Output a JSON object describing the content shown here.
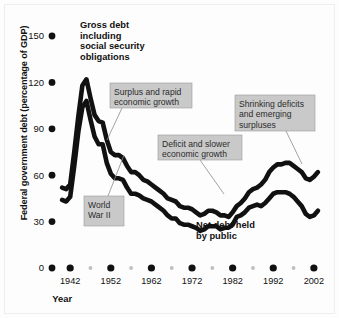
{
  "chart_data": {
    "type": "line",
    "title": "",
    "xlabel": "Year",
    "ylabel": "Federal government debt (percentage of GDP)",
    "xlim": [
      1939,
      2004
    ],
    "ylim": [
      0,
      150
    ],
    "yticks": [
      0,
      30,
      60,
      90,
      120,
      150
    ],
    "xticks": [
      1942,
      1952,
      1962,
      1972,
      1982,
      1992,
      2002
    ],
    "xticks_minor": [
      1947,
      1957,
      1967,
      1977,
      1987,
      1997
    ],
    "grid": false,
    "legend_position": "inline-annotation",
    "series": [
      {
        "name": "Gross debt including social security obligations",
        "color": "#111111",
        "x": [
          1940,
          1941,
          1942,
          1943,
          1944,
          1945,
          1946,
          1947,
          1948,
          1949,
          1950,
          1951,
          1952,
          1953,
          1954,
          1955,
          1956,
          1957,
          1958,
          1959,
          1960,
          1961,
          1962,
          1963,
          1964,
          1965,
          1966,
          1967,
          1968,
          1969,
          1970,
          1971,
          1972,
          1973,
          1974,
          1975,
          1976,
          1977,
          1978,
          1979,
          1980,
          1981,
          1982,
          1983,
          1984,
          1985,
          1986,
          1987,
          1988,
          1989,
          1990,
          1991,
          1992,
          1993,
          1994,
          1995,
          1996,
          1997,
          1998,
          1999,
          2000,
          2001,
          2002,
          2003
        ],
        "y": [
          52,
          51,
          54,
          75,
          98,
          118,
          122,
          110,
          99,
          95,
          94,
          83,
          75,
          73,
          73,
          71,
          66,
          62,
          62,
          60,
          57,
          56,
          54,
          52,
          50,
          48,
          45,
          44,
          43,
          40,
          39,
          39,
          38,
          36,
          34,
          35,
          37,
          37,
          36,
          34,
          34,
          33,
          36,
          40,
          42,
          45,
          49,
          51,
          52,
          54,
          57,
          62,
          65,
          67,
          67,
          68,
          68,
          66,
          64,
          62,
          58,
          57,
          59,
          62
        ]
      },
      {
        "name": "Net debt held by public",
        "color": "#111111",
        "x": [
          1940,
          1941,
          1942,
          1943,
          1944,
          1945,
          1946,
          1947,
          1948,
          1949,
          1950,
          1951,
          1952,
          1953,
          1954,
          1955,
          1956,
          1957,
          1958,
          1959,
          1960,
          1961,
          1962,
          1963,
          1964,
          1965,
          1966,
          1967,
          1968,
          1969,
          1970,
          1971,
          1972,
          1973,
          1974,
          1975,
          1976,
          1977,
          1978,
          1979,
          1980,
          1981,
          1982,
          1983,
          1984,
          1985,
          1986,
          1987,
          1988,
          1989,
          1990,
          1991,
          1992,
          1993,
          1994,
          1995,
          1996,
          1997,
          1998,
          1999,
          2000,
          2001,
          2002,
          2003
        ],
        "y": [
          44,
          43,
          46,
          66,
          88,
          104,
          108,
          96,
          85,
          80,
          80,
          68,
          61,
          58,
          58,
          57,
          52,
          48,
          48,
          47,
          45,
          44,
          43,
          41,
          39,
          37,
          34,
          32,
          32,
          29,
          28,
          28,
          27,
          26,
          24,
          25,
          27,
          27,
          27,
          25,
          26,
          26,
          28,
          33,
          34,
          36,
          39,
          40,
          41,
          40,
          42,
          45,
          48,
          49,
          49,
          49,
          48,
          46,
          43,
          40,
          35,
          33,
          34,
          37
        ]
      }
    ],
    "annotations": [
      {
        "id": "gross-debt-title",
        "style": "bold-text",
        "lines": [
          "Gross debt",
          "including",
          "social security",
          "obligations"
        ],
        "x": 80,
        "y": 28
      },
      {
        "id": "net-debt-title",
        "style": "bold-text",
        "lines": [
          "Net debt held",
          "by public"
        ],
        "x": 196,
        "y": 228
      },
      {
        "id": "world-war-ii",
        "style": "callout",
        "lines": [
          "World",
          "War II"
        ],
        "x": 84,
        "y": 196,
        "w": 40,
        "h": 30,
        "leader": [
          [
            108,
            196
          ],
          [
            124,
            155
          ]
        ]
      },
      {
        "id": "surplus-rapid-growth",
        "style": "callout",
        "lines": [
          "Surplus and rapid",
          "economic growth"
        ],
        "x": 110,
        "y": 83,
        "w": 82,
        "h": 25,
        "leader": [
          [
            122,
            108
          ],
          [
            107,
            140
          ]
        ]
      },
      {
        "id": "deficit-slower-growth",
        "style": "callout",
        "lines": [
          "Deficit and slower",
          "economic growth"
        ],
        "x": 158,
        "y": 135,
        "w": 84,
        "h": 25,
        "leader": [
          [
            200,
            160
          ],
          [
            224,
            194
          ]
        ]
      },
      {
        "id": "shrinking-deficits",
        "style": "callout",
        "lines": [
          "Shrinking deficits",
          "and emerging",
          "surpluses"
        ],
        "x": 235,
        "y": 95,
        "w": 80,
        "h": 36,
        "leader": [
          [
            286,
            131
          ],
          [
            302,
            164
          ]
        ]
      }
    ]
  }
}
